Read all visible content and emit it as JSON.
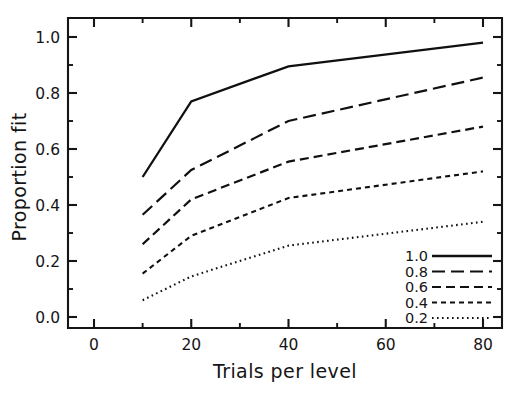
{
  "chart_data": {
    "type": "line",
    "title": "",
    "xlabel": "Trials per level",
    "ylabel": "Proportion fit",
    "xlim": [
      0,
      85
    ],
    "ylim": [
      0.0,
      1.05
    ],
    "x": [
      10,
      20,
      40,
      80
    ],
    "grid": false,
    "legend_position": "lower-right",
    "x_ticks_major": [
      0,
      20,
      40,
      60,
      80
    ],
    "x_tick_labels": [
      "0",
      "20",
      "40",
      "60",
      "80"
    ],
    "x_ticks_minor": [
      10,
      30,
      50,
      70
    ],
    "y_ticks_major": [
      0.0,
      0.2,
      0.4,
      0.6,
      0.8,
      1.0
    ],
    "y_tick_labels": [
      "0.0",
      "0.2",
      "0.4",
      "0.6",
      "0.8",
      "1.0"
    ],
    "y_ticks_minor": [
      0.1,
      0.3,
      0.5,
      0.7,
      0.9
    ],
    "series": [
      {
        "name": "1.0",
        "legend_label": "1.0",
        "style": "solid",
        "dash": "none",
        "width": 2.3,
        "values": [
          0.5,
          0.77,
          0.895,
          0.98
        ]
      },
      {
        "name": "0.8",
        "legend_label": "0.8",
        "style": "long-dash",
        "dash": "13,6",
        "width": 2.2,
        "values": [
          0.365,
          0.525,
          0.7,
          0.855
        ]
      },
      {
        "name": "0.6",
        "legend_label": "0.6",
        "style": "dash",
        "dash": "9,5",
        "width": 2.2,
        "values": [
          0.26,
          0.42,
          0.555,
          0.68
        ]
      },
      {
        "name": "0.4",
        "legend_label": "0.4",
        "style": "short-dash",
        "dash": "5,4",
        "width": 2.1,
        "values": [
          0.155,
          0.29,
          0.425,
          0.52
        ]
      },
      {
        "name": "0.2",
        "legend_label": "0.2",
        "style": "dotted",
        "dash": "1.6,3.4",
        "width": 2.1,
        "values": [
          0.06,
          0.145,
          0.255,
          0.34
        ]
      }
    ]
  },
  "axes": {
    "x_title": "Trials per level",
    "y_title": "Proportion fit"
  },
  "legend": {
    "entries": [
      {
        "label": "1.0"
      },
      {
        "label": "0.8"
      },
      {
        "label": "0.6"
      },
      {
        "label": "0.4"
      },
      {
        "label": "0.2"
      }
    ]
  },
  "colors": {
    "ink": "#151515",
    "line": "#101010",
    "background": "#ffffff"
  }
}
